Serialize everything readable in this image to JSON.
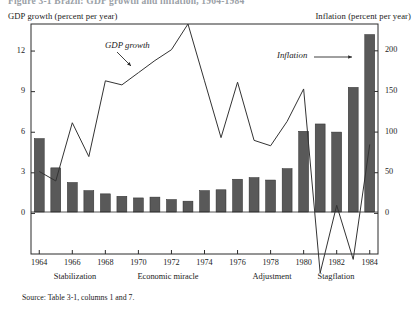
{
  "figure": {
    "title_partial": "Figure 3-1  Brazil: GDP growth and inflation, 1964-1984",
    "source_note": "Source: Table 3-1, columns 1 and 7.",
    "left_axis_caption": "GDP growth (percent per year)",
    "right_axis_caption": "Inflation (percent per year)"
  },
  "annotations": {
    "gdp_label": "GDP growth",
    "inflation_label": "Inflation"
  },
  "eras": [
    {
      "label": "Stabilization",
      "center_x": 75
    },
    {
      "label": "Economic miracle",
      "center_x": 168
    },
    {
      "label": "Adjustment",
      "center_x": 272
    },
    {
      "label": "Stagflation",
      "center_x": 336
    }
  ],
  "chart_data": {
    "type": "bar",
    "title": "Brazil: GDP growth and inflation, 1964-1984",
    "xlabel": "",
    "ylabel": "GDP growth (percent per year)",
    "y2label": "Inflation (percent per year)",
    "grid": false,
    "legend": "annotated-inline",
    "x": [
      1964,
      1965,
      1966,
      1967,
      1968,
      1969,
      1970,
      1971,
      1972,
      1973,
      1974,
      1975,
      1976,
      1977,
      1978,
      1979,
      1980,
      1981,
      1982,
      1983,
      1984
    ],
    "xtick_labels": [
      "1964",
      "1966",
      "1968",
      "1970",
      "1972",
      "1974",
      "1976",
      "1978",
      "1980",
      "1982",
      "1984"
    ],
    "xtick_values": [
      1964,
      1966,
      1968,
      1970,
      1972,
      1974,
      1976,
      1978,
      1980,
      1982,
      1984
    ],
    "ylim": [
      -3,
      14
    ],
    "ytick_labels": [
      "0",
      "3",
      "6",
      "9",
      "12"
    ],
    "ytick_values": [
      0,
      3,
      6,
      9,
      12
    ],
    "y2lim": [
      -50,
      233
    ],
    "y2tick_labels": [
      "0",
      "50",
      "100",
      "150",
      "200"
    ],
    "y2tick_values": [
      0,
      50,
      100,
      150,
      200
    ],
    "series": [
      {
        "name": "Inflation",
        "type": "bar",
        "axis": "right",
        "unit": "percent per year",
        "color": "#595959",
        "values": [
          92,
          56,
          38,
          28,
          24,
          21,
          19,
          20,
          17,
          15,
          28,
          29,
          42,
          44,
          41,
          55,
          101,
          110,
          100,
          155,
          220
        ]
      },
      {
        "name": "GDP growth",
        "type": "line",
        "axis": "left",
        "unit": "percent per year",
        "color": "#333333",
        "values": [
          3.1,
          2.4,
          6.7,
          4.2,
          9.8,
          9.5,
          10.4,
          11.3,
          12.1,
          14.0,
          9.8,
          5.6,
          9.7,
          5.4,
          5.0,
          6.8,
          9.2,
          -4.4,
          0.6,
          -3.4,
          5.1
        ]
      }
    ]
  }
}
